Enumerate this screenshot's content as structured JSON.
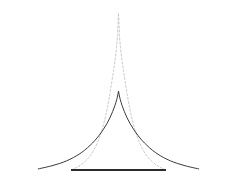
{
  "figure": {
    "name": "two-peaked-density-comparison",
    "width": 237,
    "height": 191,
    "background_color": "#ffffff"
  },
  "colors": {
    "solid_curve": "#3a3a3a",
    "dashed_curve": "#c8c8c8",
    "baseline": "#2b2b2b"
  },
  "chart_data": {
    "type": "line",
    "title": "",
    "subtitle": "",
    "xlabel": "",
    "ylabel": "",
    "grid": false,
    "legend_position": "none",
    "axis_visible": {
      "x_axis": true,
      "y_axis": false,
      "ticks": false,
      "tick_labels": false
    },
    "xlim": [
      -4,
      4
    ],
    "ylim": [
      0,
      1
    ],
    "annotations": [],
    "series": [
      {
        "name": "narrow-peaked-curve",
        "style": "dashed",
        "color": "#c8c8c8",
        "linewidth": 1,
        "dash_pattern": "2,2",
        "peak_x": 0,
        "peak_y": 1.0,
        "x": [
          -2.1,
          -1.9,
          -1.7,
          -1.5,
          -1.3,
          -1.1,
          -0.9,
          -0.75,
          -0.6,
          -0.5,
          -0.4,
          -0.3,
          -0.22,
          -0.15,
          -0.09,
          -0.04,
          0,
          0.04,
          0.09,
          0.15,
          0.22,
          0.3,
          0.4,
          0.5,
          0.6,
          0.75,
          0.9,
          1.1,
          1.3,
          1.5,
          1.7,
          1.9,
          2.1
        ],
        "y": [
          0.0,
          0.013,
          0.03,
          0.052,
          0.082,
          0.125,
          0.185,
          0.245,
          0.325,
          0.39,
          0.468,
          0.558,
          0.632,
          0.702,
          0.778,
          0.862,
          1.0,
          0.862,
          0.778,
          0.702,
          0.632,
          0.558,
          0.468,
          0.39,
          0.325,
          0.245,
          0.185,
          0.125,
          0.082,
          0.052,
          0.03,
          0.013,
          0.0
        ]
      },
      {
        "name": "broad-peaked-curve",
        "style": "solid",
        "color": "#3a3a3a",
        "linewidth": 1,
        "dash_pattern": "none",
        "peak_x": 0,
        "peak_y": 0.503,
        "x": [
          -3.55,
          -3.2,
          -2.9,
          -2.6,
          -2.3,
          -2.0,
          -1.75,
          -1.5,
          -1.25,
          -1.05,
          -0.85,
          -0.68,
          -0.52,
          -0.38,
          -0.26,
          -0.16,
          -0.08,
          -0.03,
          0,
          0.03,
          0.08,
          0.16,
          0.26,
          0.38,
          0.52,
          0.68,
          0.85,
          1.05,
          1.25,
          1.5,
          1.75,
          2.0,
          2.3,
          2.6,
          2.9,
          3.2,
          3.55
        ],
        "y": [
          0.007,
          0.018,
          0.029,
          0.042,
          0.058,
          0.079,
          0.1,
          0.126,
          0.158,
          0.187,
          0.222,
          0.256,
          0.294,
          0.332,
          0.372,
          0.41,
          0.448,
          0.478,
          0.503,
          0.478,
          0.448,
          0.41,
          0.372,
          0.332,
          0.294,
          0.256,
          0.222,
          0.187,
          0.158,
          0.126,
          0.1,
          0.079,
          0.058,
          0.042,
          0.029,
          0.018,
          0.007
        ]
      },
      {
        "name": "baseline-axis",
        "style": "solid",
        "color": "#2b2b2b",
        "linewidth": 2,
        "dash_pattern": "none",
        "x": [
          -2.1,
          2.1
        ],
        "y": [
          0,
          0
        ]
      }
    ]
  }
}
